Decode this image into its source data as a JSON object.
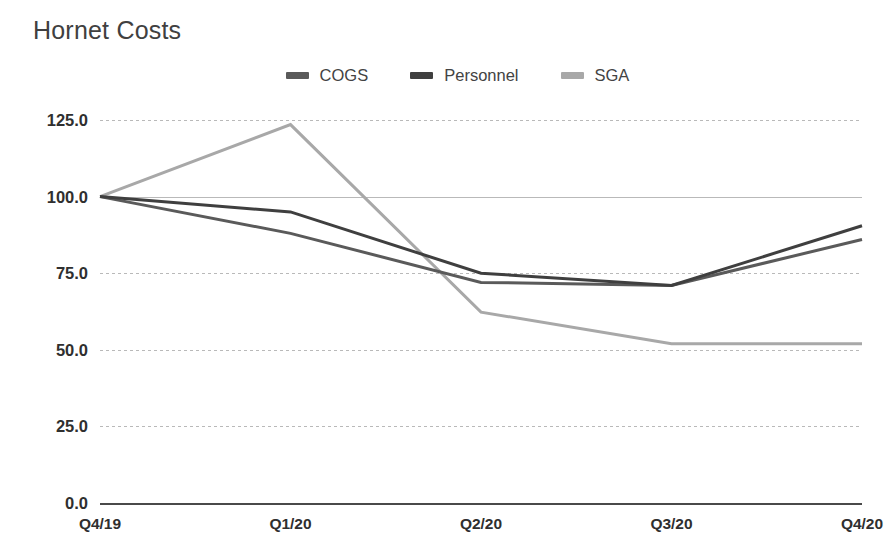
{
  "chart_data": {
    "type": "line",
    "title": "Hornet Costs",
    "xlabel": "",
    "ylabel": "",
    "categories": [
      "Q4/19",
      "Q1/20",
      "Q2/20",
      "Q3/20",
      "Q4/20"
    ],
    "ylim": [
      0,
      125
    ],
    "yticks": [
      "0.0",
      "25.0",
      "50.0",
      "75.0",
      "100.0",
      "125.0"
    ],
    "ytick_values": [
      0,
      25,
      50,
      75,
      100,
      125
    ],
    "grid": true,
    "legend_position": "top-center",
    "series": [
      {
        "name": "COGS",
        "color": "#5a5a5a",
        "values": [
          100.0,
          88.0,
          72.0,
          71.0,
          86.0
        ]
      },
      {
        "name": "Personnel",
        "color": "#3f3f3f",
        "values": [
          100.0,
          95.0,
          75.0,
          71.0,
          90.5
        ]
      },
      {
        "name": "SGA",
        "color": "#a8a8a8",
        "values": [
          100.0,
          123.5,
          62.3,
          52.0,
          52.0
        ]
      }
    ]
  },
  "colors": {
    "background": "#ffffff",
    "title_text": "#404040",
    "tick_text": "#2f2f2f",
    "gridline": "#b9b9b9",
    "axis": "#4a4a4a"
  }
}
